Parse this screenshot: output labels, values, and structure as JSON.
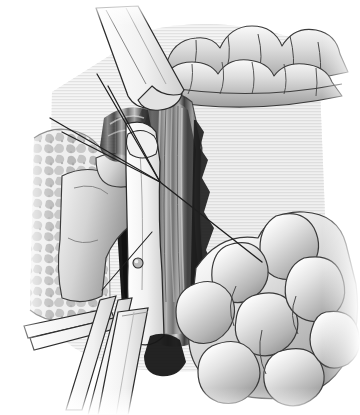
{
  "figure": {
    "title": "Surgical field illustration — rectal stump transection with bowel loops",
    "domain": "medical-line-art",
    "width_px": 360,
    "height_px": 415,
    "style": "grayscale stipple and hatch medical illustration",
    "background_color": "#ffffff",
    "has_text_labels": false,
    "caption": ""
  },
  "palette": {
    "background": "#ffffff",
    "paper_white": "#fbfbfb",
    "tissue_light": "#e9e9e9",
    "tissue_mid": "#c6c6c6",
    "tissue_shade": "#9a9a9a",
    "tissue_dark": "#6a6a6a",
    "cavity_shadow": "#3a3a3a",
    "cavity_black": "#171717",
    "instrument_fill": "#f4f4f4",
    "instrument_edge": "#2a2a2a",
    "outline": "#333333",
    "suture_line": "#1f1f1f"
  },
  "regions": [
    {
      "id": "mesentery-fat-pad",
      "name": "stippled fatty tissue pad",
      "side": "left",
      "texture": "mottled-stipple",
      "bbox": [
        8,
        128,
        110,
        210
      ],
      "fill": "#dcdcdc"
    },
    {
      "id": "transverse-colon",
      "name": "haustrated bowel segment",
      "side": "top-right",
      "texture": "lobed-haustra",
      "bbox": [
        160,
        22,
        190,
        100
      ],
      "lobe_count": 9
    },
    {
      "id": "small-bowel-loops",
      "name": "coiled small bowel loops",
      "side": "bottom-right",
      "texture": "rounded-lobes",
      "bbox": [
        185,
        205,
        170,
        200
      ],
      "lobe_count": 11
    },
    {
      "id": "rectal-stump",
      "name": "transected tubular stump with longitudinal striation",
      "side": "center",
      "texture": "vertical-banding",
      "bbox": [
        130,
        90,
        70,
        260
      ]
    },
    {
      "id": "deep-cavity",
      "name": "deep pelvic cavity shadow",
      "side": "center-left",
      "texture": "solid-dark",
      "bbox": [
        108,
        115,
        60,
        230
      ],
      "fill": "#171717"
    },
    {
      "id": "peritoneal-flap",
      "name": "retracted peritoneal flap",
      "side": "mid-left",
      "texture": "smooth-gradient",
      "bbox": [
        58,
        168,
        92,
        115
      ]
    }
  ],
  "instruments": [
    {
      "id": "upper-retractor",
      "name": "angled ribbon retractor blade",
      "position": "upper-left",
      "angle_deg": 28,
      "has_beveled_tip": true
    },
    {
      "id": "clamp-jaw",
      "name": "clamp jaw with pivot rivet",
      "position": "center",
      "has_rivet": true,
      "rivet_center": [
        138,
        263
      ],
      "rivet_radius_px": 5
    },
    {
      "id": "lower-retractor-a",
      "name": "flat retractor shaft",
      "position": "lower-left",
      "angle_deg": 72
    },
    {
      "id": "lower-retractor-b",
      "name": "flat retractor shaft second",
      "position": "lower-left",
      "angle_deg": 76
    },
    {
      "id": "lower-blade",
      "name": "broad retractor blade",
      "position": "bottom-center",
      "angle_deg": 80
    }
  ],
  "sutures": [
    {
      "id": "suture-1",
      "from": [
        50,
        118
      ],
      "to": [
        160,
        182
      ],
      "note": "upper traction thread"
    },
    {
      "id": "suture-2",
      "from": [
        62,
        132
      ],
      "to": [
        160,
        182
      ],
      "note": "second traction thread"
    },
    {
      "id": "suture-3",
      "from": [
        97,
        74
      ],
      "to": [
        160,
        182
      ],
      "note": "steep thread from retractor"
    },
    {
      "id": "suture-4",
      "from": [
        108,
        86
      ],
      "to": [
        160,
        182
      ],
      "note": "parallel steep thread"
    },
    {
      "id": "suture-5",
      "from": [
        160,
        182
      ],
      "to": [
        262,
        262
      ],
      "note": "long diagonal thread to bowel loop"
    },
    {
      "id": "suture-6",
      "from": [
        102,
        290
      ],
      "to": [
        152,
        232
      ],
      "note": "short lower thread"
    }
  ],
  "annotations": {
    "suture_convergence_point": [
      160,
      182
    ],
    "notes": "No visible text, axis, legend, or caption in the source image."
  }
}
